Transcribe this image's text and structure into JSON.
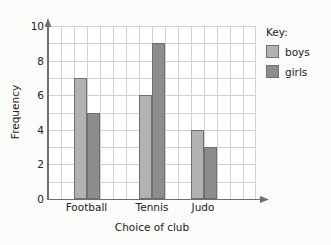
{
  "chart_data": {
    "type": "bar",
    "title": "",
    "xlabel": "Choice of club",
    "ylabel": "Frequency",
    "categories": [
      "Football",
      "Tennis",
      "Judo"
    ],
    "series": [
      {
        "name": "boys",
        "values": [
          7,
          6,
          4
        ],
        "color": "#b2b2b2"
      },
      {
        "name": "girls",
        "values": [
          5,
          9,
          3
        ],
        "color": "#8d8d8d"
      }
    ],
    "ylim": [
      0,
      10
    ],
    "ytick_labels": [
      "0",
      "2",
      "4",
      "6",
      "8",
      "10"
    ],
    "ytick_values": [
      0,
      2,
      4,
      6,
      8,
      10
    ],
    "y_minor_step": 1,
    "grid": true,
    "grid_color": "#c9d2dd",
    "legend_position": "right",
    "legend_title": "Key:",
    "axis_color": "#6f6f6f",
    "background": "#fbfbf9",
    "plot_background": "#ffffff",
    "bar_border_color": "#6f6f6f",
    "axis_arrows": true
  },
  "legend": {
    "title": "Key:",
    "entries": [
      {
        "label": "boys",
        "color": "#b2b2b2"
      },
      {
        "label": "girls",
        "color": "#8d8d8d"
      }
    ]
  },
  "axes": {
    "y_title": "Frequency",
    "x_title": "Choice of club",
    "y_ticks": [
      "10",
      "8",
      "6",
      "4",
      "2",
      "0"
    ],
    "x_ticks": [
      "Football",
      "Tennis",
      "Judo"
    ]
  }
}
